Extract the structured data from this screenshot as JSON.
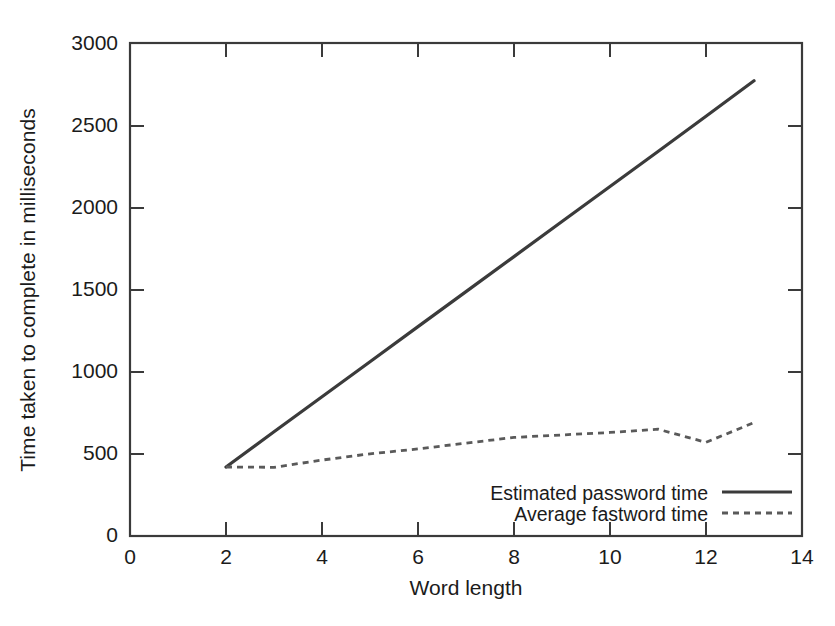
{
  "chart_data": {
    "type": "line",
    "title": "",
    "xlabel": "Word length",
    "ylabel": "Time taken to complete in milliseconds",
    "xlim": [
      0,
      14
    ],
    "ylim": [
      0,
      3000
    ],
    "xticks": [
      0,
      2,
      4,
      6,
      8,
      10,
      12,
      14
    ],
    "yticks": [
      0,
      500,
      1000,
      1500,
      2000,
      2500,
      3000
    ],
    "grid": false,
    "legend_position": "lower right (inside axes)",
    "series": [
      {
        "name": "Estimated password time",
        "style": "solid",
        "color": "#3b3b3b",
        "x": [
          2,
          3,
          4,
          5,
          6,
          7,
          8,
          9,
          10,
          11,
          12,
          13
        ],
        "values": [
          420,
          634,
          847,
          1060,
          1274,
          1487,
          1700,
          1914,
          2127,
          2340,
          2554,
          2770
        ]
      },
      {
        "name": "Average fastword time",
        "style": "dashed",
        "color": "#5a5a5a",
        "x": [
          2,
          3,
          4,
          5,
          6,
          7,
          8,
          9,
          10,
          11,
          12,
          13
        ],
        "values": [
          420,
          418,
          462,
          500,
          530,
          565,
          600,
          615,
          630,
          650,
          570,
          690
        ]
      }
    ]
  },
  "axis": {
    "ylabel": "Time taken to complete in milliseconds",
    "xlabel": "Word length",
    "ytick_labels": [
      "3000",
      "2500",
      "2000",
      "1500",
      "1000",
      "500",
      "0"
    ],
    "xtick_labels": [
      "0",
      "2",
      "4",
      "6",
      "8",
      "10",
      "12",
      "14"
    ]
  },
  "legend": {
    "entries": [
      {
        "label": "Estimated password time",
        "style": "solid"
      },
      {
        "label": "Average fastword time",
        "style": "dashed"
      }
    ]
  },
  "colors": {
    "background": "#ffffff",
    "frame": "#3a3a3a",
    "series_solid": "#3b3b3b",
    "series_dashed": "#5a5a5a",
    "text": "#1b1b1b"
  }
}
